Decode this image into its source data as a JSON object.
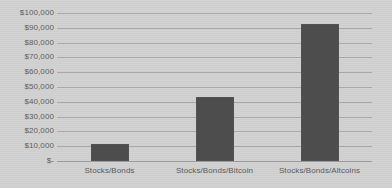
{
  "chart_data": {
    "type": "bar",
    "title": "",
    "subtitle": "",
    "xlabel": "",
    "ylabel": "",
    "categories": [
      "Stocks/Bonds",
      "Stocks/Bonds/Bitcoin",
      "Stocks/Bonds/Altcoins"
    ],
    "values": [
      11500,
      43000,
      92500
    ],
    "ylim": [
      0,
      100000
    ],
    "ytick_values": [
      0,
      10000,
      20000,
      30000,
      40000,
      50000,
      60000,
      70000,
      80000,
      90000,
      100000
    ],
    "ytick_labels": [
      "$-",
      "$10,000",
      "$20,000",
      "$30,000",
      "$40,000",
      "$50,000",
      "$60,000",
      "$70,000",
      "$80,000",
      "$90,000",
      "$100,000"
    ],
    "grid": "horizontal",
    "legend": "none",
    "annotations": []
  },
  "style": {
    "background_color": "#d1d1d1",
    "bar_color": "#4d4d4d",
    "gridline_color": "#a8a8a8",
    "label_color": "#5a5a5a"
  }
}
